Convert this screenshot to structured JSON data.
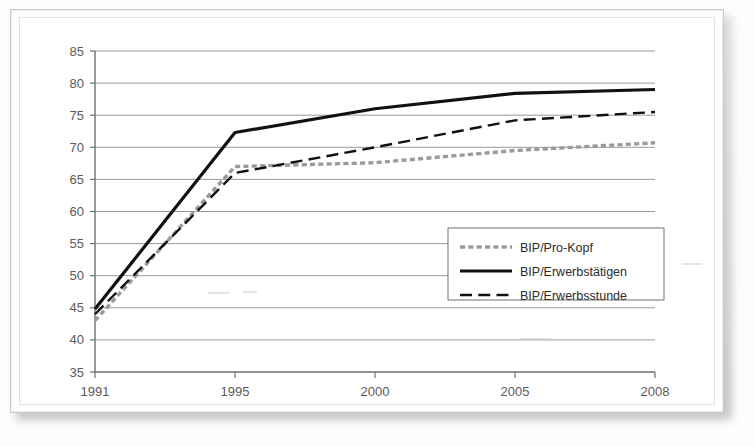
{
  "document": {
    "kind": "scanned-figure",
    "frame_color": "#c9c9c9",
    "page_background": "#fdfdfd"
  },
  "chart_data": {
    "type": "line",
    "title": "",
    "subtitle": "",
    "xlabel": "",
    "ylabel": "",
    "categories": [
      "1991",
      "1995",
      "2000",
      "2005",
      "2008"
    ],
    "x": [
      1991,
      1995,
      2000,
      2005,
      2008
    ],
    "ylim": [
      35,
      85
    ],
    "yticks": [
      35,
      40,
      45,
      50,
      55,
      60,
      65,
      70,
      75,
      80,
      85
    ],
    "grid": "horizontal",
    "legend_position": "inside-center-right",
    "series": [
      {
        "name": "BIP/Pro-Kopf",
        "values": [
          43.0,
          67.0,
          67.6,
          69.5,
          70.7
        ],
        "color": "#9a9a9a",
        "style": "dotted",
        "width": 3.4
      },
      {
        "name": "BIP/Erwerbstätigen",
        "values": [
          44.8,
          72.3,
          76.0,
          78.4,
          79.0
        ],
        "color": "#111111",
        "style": "solid",
        "width": 3.2
      },
      {
        "name": "BIP/Erwerbsstunde",
        "values": [
          44.0,
          66.0,
          70.0,
          74.2,
          75.5
        ],
        "color": "#111111",
        "style": "dashed",
        "width": 2.4
      }
    ]
  },
  "axes": {
    "y_tick_labels": [
      "85",
      "80",
      "75",
      "70",
      "65",
      "60",
      "55",
      "50",
      "45",
      "40",
      "35"
    ],
    "x_tick_labels": [
      "1991",
      "1995",
      "2000",
      "2005",
      "2008"
    ]
  },
  "legend": {
    "entries": [
      {
        "label": "BIP/Pro-Kopf"
      },
      {
        "label": "BIP/Erwerbstätigen"
      },
      {
        "label": "BIP/Erwerbsstunde"
      }
    ]
  }
}
